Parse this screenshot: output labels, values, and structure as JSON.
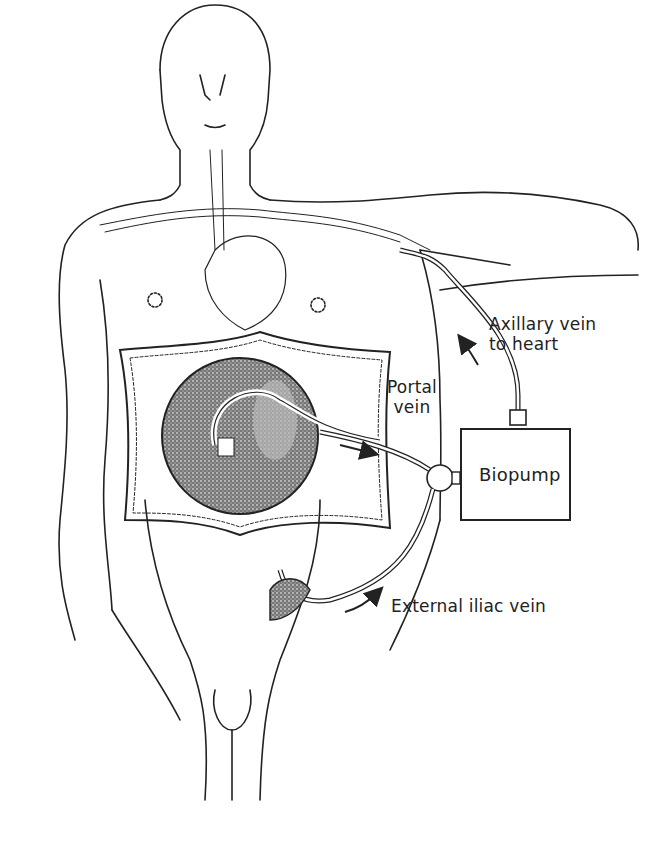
{
  "diagram": {
    "labels": {
      "axillary_line1": "Axillary vein",
      "axillary_line2": "to heart",
      "portal_line1": "Portal",
      "portal_line2": "vein",
      "pump": "Biopump",
      "iliac": "External iliac vein"
    },
    "colors": {
      "line": "#222222",
      "stipple": "#555555",
      "background": "#ffffff"
    }
  }
}
